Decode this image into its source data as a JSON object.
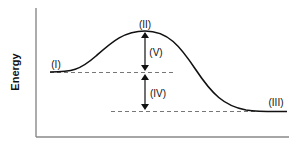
{
  "diagram": {
    "type": "energy-profile",
    "ylabel": "Energy",
    "labels": {
      "reactants": "(I)",
      "transition_state": "(II)",
      "products": "(III)",
      "energy_difference_reaction": "(IV)",
      "activation_energy": "(V)"
    },
    "colors": {
      "curve": "#111111",
      "axis": "#888888",
      "dashed": "#777777",
      "arrow": "#111111"
    }
  }
}
